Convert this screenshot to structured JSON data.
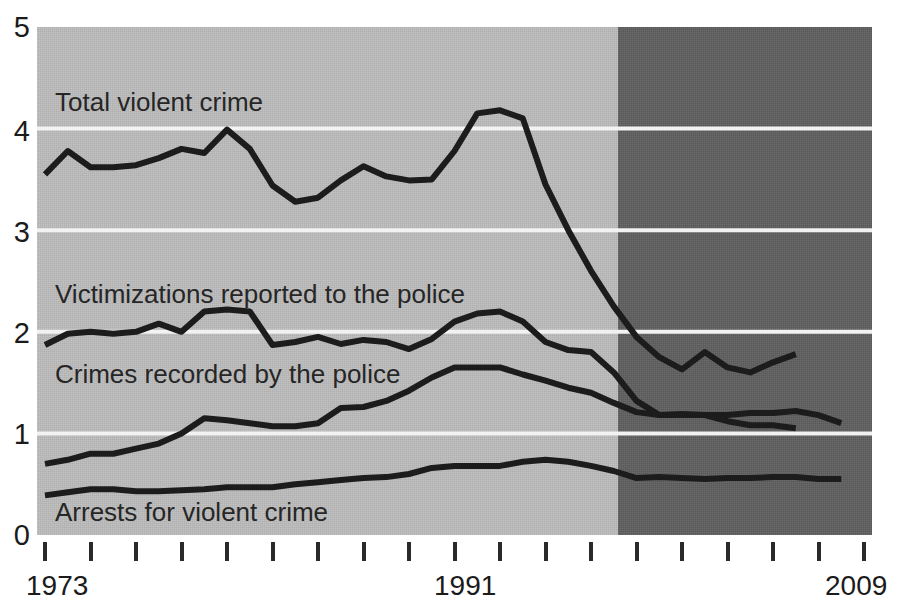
{
  "chart_data": {
    "type": "line",
    "title": "",
    "xlabel": "",
    "ylabel": "",
    "xlim": [
      1973,
      2009
    ],
    "ylim": [
      0,
      5
    ],
    "grid": true,
    "gridlines_y": [
      1,
      2,
      3,
      4
    ],
    "y_ticks": [
      "5",
      "4",
      "3",
      "2",
      "1",
      "0"
    ],
    "x_tick_labels_shown": [
      "1973",
      "1991",
      "2009"
    ],
    "x_tick_years": [
      1973,
      1975,
      1977,
      1979,
      1981,
      1983,
      1985,
      1987,
      1989,
      1991,
      1993,
      1995,
      1997,
      1999,
      2001,
      2003,
      2005,
      2007,
      2009
    ],
    "x_tick_count": 19,
    "shaded_regions": [
      {
        "name": "light-band",
        "from": 1973,
        "to": 1998,
        "color": "#bcbcbc"
      },
      {
        "name": "dark-band",
        "from": 1998,
        "to": 2009,
        "color": "#5e5e5e"
      }
    ],
    "legend_position": "inline-labels",
    "series": [
      {
        "name": "Total violent crime",
        "color": "#1c1c1c",
        "label_x": 1974,
        "label_y": 4.35,
        "x": [
          1973,
          1974,
          1975,
          1976,
          1977,
          1978,
          1979,
          1980,
          1981,
          1982,
          1983,
          1984,
          1985,
          1986,
          1987,
          1988,
          1989,
          1990,
          1991,
          1992,
          1993,
          1994,
          1995,
          1996,
          1997,
          1998,
          1999,
          2000,
          2001,
          2002,
          2003,
          2004,
          2005,
          2006,
          2007,
          2008
        ],
        "values": [
          3.55,
          3.78,
          3.62,
          3.62,
          3.64,
          3.71,
          3.8,
          3.76,
          3.99,
          3.8,
          3.44,
          3.28,
          3.32,
          3.49,
          3.63,
          3.53,
          3.49,
          3.5,
          3.78,
          4.15,
          4.18,
          4.1,
          3.45,
          3.0,
          2.6,
          2.25,
          1.95,
          1.75,
          1.63,
          1.8,
          1.65,
          1.6,
          1.7,
          1.78,
          null,
          null
        ]
      },
      {
        "name": "Victimizations reported to the police",
        "color": "#1c1c1c",
        "label_x": 1974,
        "label_y": 2.42,
        "x": [
          1973,
          1974,
          1975,
          1976,
          1977,
          1978,
          1979,
          1980,
          1981,
          1982,
          1983,
          1984,
          1985,
          1986,
          1987,
          1988,
          1989,
          1990,
          1991,
          1992,
          1993,
          1994,
          1995,
          1996,
          1997,
          1998,
          1999,
          2000,
          2001,
          2002,
          2003,
          2004,
          2005,
          2006,
          2007,
          2008
        ],
        "values": [
          1.87,
          1.98,
          2.0,
          1.98,
          2.0,
          2.08,
          2.0,
          2.2,
          2.22,
          2.2,
          1.87,
          1.9,
          1.95,
          1.88,
          1.92,
          1.9,
          1.83,
          1.93,
          2.1,
          2.18,
          2.2,
          2.1,
          1.9,
          1.82,
          1.8,
          1.6,
          1.32,
          1.18,
          1.18,
          1.18,
          1.12,
          1.08,
          1.08,
          1.05,
          null,
          null
        ]
      },
      {
        "name": "Crimes recorded by the police",
        "color": "#1c1c1c",
        "label_x": 1974,
        "label_y": 1.63,
        "x": [
          1973,
          1974,
          1975,
          1976,
          1977,
          1978,
          1979,
          1980,
          1981,
          1982,
          1983,
          1984,
          1985,
          1986,
          1987,
          1988,
          1989,
          1990,
          1991,
          1992,
          1993,
          1994,
          1995,
          1996,
          1997,
          1998,
          1999,
          2000,
          2001,
          2002,
          2003,
          2004,
          2005,
          2006,
          2007,
          2008
        ],
        "values": [
          0.7,
          0.74,
          0.8,
          0.8,
          0.85,
          0.9,
          1.0,
          1.15,
          1.13,
          1.1,
          1.07,
          1.07,
          1.1,
          1.25,
          1.26,
          1.32,
          1.42,
          1.55,
          1.65,
          1.65,
          1.65,
          1.58,
          1.52,
          1.45,
          1.4,
          1.3,
          1.21,
          1.18,
          1.19,
          1.18,
          1.18,
          1.2,
          1.2,
          1.22,
          1.18,
          1.1
        ]
      },
      {
        "name": "Arrests for violent crime",
        "color": "#1c1c1c",
        "label_x": 1974,
        "label_y": 0.28,
        "x": [
          1973,
          1974,
          1975,
          1976,
          1977,
          1978,
          1979,
          1980,
          1981,
          1982,
          1983,
          1984,
          1985,
          1986,
          1987,
          1988,
          1989,
          1990,
          1991,
          1992,
          1993,
          1994,
          1995,
          1996,
          1997,
          1998,
          1999,
          2000,
          2001,
          2002,
          2003,
          2004,
          2005,
          2006,
          2007,
          2008
        ],
        "values": [
          0.39,
          0.42,
          0.45,
          0.45,
          0.43,
          0.43,
          0.44,
          0.45,
          0.47,
          0.47,
          0.47,
          0.5,
          0.52,
          0.54,
          0.56,
          0.57,
          0.6,
          0.66,
          0.68,
          0.68,
          0.68,
          0.72,
          0.74,
          0.72,
          0.68,
          0.63,
          0.56,
          0.57,
          0.56,
          0.55,
          0.56,
          0.56,
          0.57,
          0.57,
          0.55,
          0.55
        ]
      }
    ]
  },
  "axis": {
    "y_labels": [
      "5",
      "4",
      "3",
      "2",
      "1",
      "0"
    ],
    "x_left_label": "1973",
    "x_mid_label": "1991",
    "x_right_label": "2009"
  },
  "series_labels": {
    "total_violent_crime": "Total violent crime",
    "victimizations_reported": "Victimizations reported to the police",
    "crimes_recorded": "Crimes recorded by the police",
    "arrests": "Arrests for violent crime"
  }
}
